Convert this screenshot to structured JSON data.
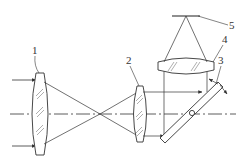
{
  "diagram": {
    "type": "optical-schematic",
    "colors": {
      "line": "#333333",
      "hatch": "#777777",
      "background": "#ffffff"
    },
    "labels": [
      {
        "id": "1",
        "text": "1",
        "part": "objective-lens"
      },
      {
        "id": "2",
        "text": "2",
        "part": "collimating-lens"
      },
      {
        "id": "3",
        "text": "3",
        "part": "scanning-mirror"
      },
      {
        "id": "4",
        "text": "4",
        "part": "focusing-lens"
      },
      {
        "id": "5",
        "text": "5",
        "part": "detector"
      }
    ]
  }
}
